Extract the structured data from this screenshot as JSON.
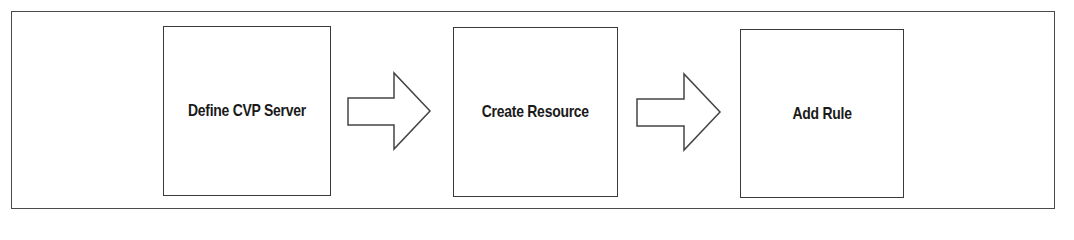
{
  "diagram": {
    "type": "flowchart",
    "direction": "left-to-right",
    "steps": [
      {
        "label": "Define CVP Server"
      },
      {
        "label": "Create Resource"
      },
      {
        "label": "Add Rule"
      }
    ],
    "connectors": [
      {
        "from": "Define CVP Server",
        "to": "Create Resource",
        "style": "block-arrow"
      },
      {
        "from": "Create Resource",
        "to": "Add Rule",
        "style": "block-arrow"
      }
    ],
    "colors": {
      "border": "#3a3a3a",
      "fill": "#ffffff",
      "text": "#1a1a1a"
    }
  }
}
